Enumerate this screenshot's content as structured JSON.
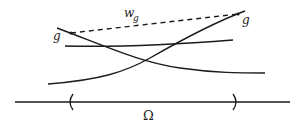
{
  "diagram": {
    "labels": {
      "g_left": "g",
      "g_right": "g",
      "w": "w",
      "w_sub": "g",
      "omega": "Ω"
    },
    "colors": {
      "stroke": "#1a1a1a",
      "background": "#ffffff"
    },
    "elements": [
      {
        "id": "curve-descending",
        "description": "curve from upper-left down to lower-right"
      },
      {
        "id": "curve-ascending",
        "description": "curve from lower-left up to upper-right"
      },
      {
        "id": "curve-flat",
        "description": "nearly horizontal curve"
      },
      {
        "id": "dashed-segment",
        "description": "dashed segment w_g connecting the two g points"
      },
      {
        "id": "domain-axis",
        "description": "horizontal axis with interval Ω marked by parentheses"
      }
    ]
  }
}
